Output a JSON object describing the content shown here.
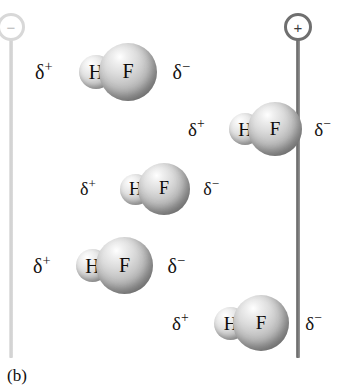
{
  "figure": {
    "caption": "(b)",
    "width": 340,
    "height": 389,
    "background_color": "#ffffff"
  },
  "electrodes": [
    {
      "name": "negative-electrode",
      "sign": "−",
      "polarity": "negative",
      "color": "#cfcfcf",
      "x": 25,
      "top": 13,
      "rod_height": 319
    },
    {
      "name": "positive-electrode",
      "sign": "+",
      "polarity": "positive",
      "color": "#6e6e6e",
      "x": 312,
      "top": 13,
      "rod_height": 319
    }
  ],
  "molecules": [
    {
      "id": "hf-molecule-1",
      "delta_plus": "δ",
      "delta_plus_sup": "+",
      "delta_minus": "δ",
      "delta_minus_sup": "−",
      "hydrogen_label": "H",
      "fluorine_label": "F",
      "left": 35,
      "top": 41,
      "width": 155,
      "height": 62,
      "scale": 1.0
    },
    {
      "id": "hf-molecule-2",
      "delta_plus": "δ",
      "delta_plus_sup": "+",
      "delta_minus": "δ",
      "delta_minus_sup": "−",
      "hydrogen_label": "H",
      "fluorine_label": "F",
      "left": 188,
      "top": 100,
      "width": 143,
      "height": 58,
      "scale": 0.93
    },
    {
      "id": "hf-molecule-3",
      "delta_plus": "δ",
      "delta_plus_sup": "+",
      "delta_minus": "δ",
      "delta_minus_sup": "−",
      "hydrogen_label": "H",
      "fluorine_label": "F",
      "left": 80,
      "top": 161,
      "width": 139,
      "height": 56,
      "scale": 0.9
    },
    {
      "id": "hf-molecule-4",
      "delta_plus": "δ",
      "delta_plus_sup": "+",
      "delta_minus": "δ",
      "delta_minus_sup": "−",
      "hydrogen_label": "H",
      "fluorine_label": "F",
      "left": 33,
      "top": 235,
      "width": 152,
      "height": 61,
      "scale": 0.98
    },
    {
      "id": "hf-molecule-5",
      "delta_plus": "δ",
      "delta_plus_sup": "+",
      "delta_minus": "δ",
      "delta_minus_sup": "−",
      "hydrogen_label": "H",
      "fluorine_label": "F",
      "left": 172,
      "top": 293,
      "width": 150,
      "height": 60,
      "scale": 0.96
    }
  ]
}
